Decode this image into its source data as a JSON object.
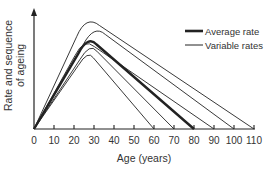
{
  "chart_data": {
    "type": "line",
    "title": "",
    "xlabel": "Age (years)",
    "ylabel_lines": [
      "Rate and sequence",
      "of ageing"
    ],
    "xlim": [
      0,
      110
    ],
    "ylim": [
      0,
      100
    ],
    "x_ticks": [
      0,
      10,
      20,
      30,
      40,
      50,
      60,
      70,
      80,
      90,
      100,
      110
    ],
    "x_tick_labels": [
      "0",
      "10",
      "20",
      "30",
      "40",
      "50",
      "60",
      "70",
      "80",
      "90",
      "100",
      "110"
    ],
    "y_ticks": [],
    "grid": false,
    "legend_position": "top-right",
    "legend": [
      {
        "label": "Average rate",
        "style": "thick"
      },
      {
        "label": "Variable rates",
        "style": "thin"
      }
    ],
    "series": [
      {
        "name": "Variable rates",
        "style": "thin",
        "points": [
          [
            0,
            0
          ],
          [
            26,
            93
          ],
          [
            110,
            0
          ]
        ]
      },
      {
        "name": "Variable rates",
        "style": "thin",
        "points": [
          [
            0,
            0
          ],
          [
            30,
            85
          ],
          [
            100,
            0
          ]
        ]
      },
      {
        "name": "Variable rates",
        "style": "thin",
        "points": [
          [
            0,
            0
          ],
          [
            25,
            74
          ],
          [
            90,
            0
          ]
        ]
      },
      {
        "name": "Average rate",
        "style": "thick",
        "points": [
          [
            0,
            0
          ],
          [
            27,
            76
          ],
          [
            80,
            0
          ]
        ]
      },
      {
        "name": "Variable rates",
        "style": "thin",
        "points": [
          [
            0,
            0
          ],
          [
            28,
            70
          ],
          [
            70,
            0
          ]
        ]
      },
      {
        "name": "Variable rates",
        "style": "thin",
        "points": [
          [
            0,
            0
          ],
          [
            27,
            64
          ],
          [
            60,
            0
          ]
        ]
      }
    ]
  },
  "colors": {
    "line": "#222222",
    "axis": "#222222",
    "text": "#333333"
  }
}
